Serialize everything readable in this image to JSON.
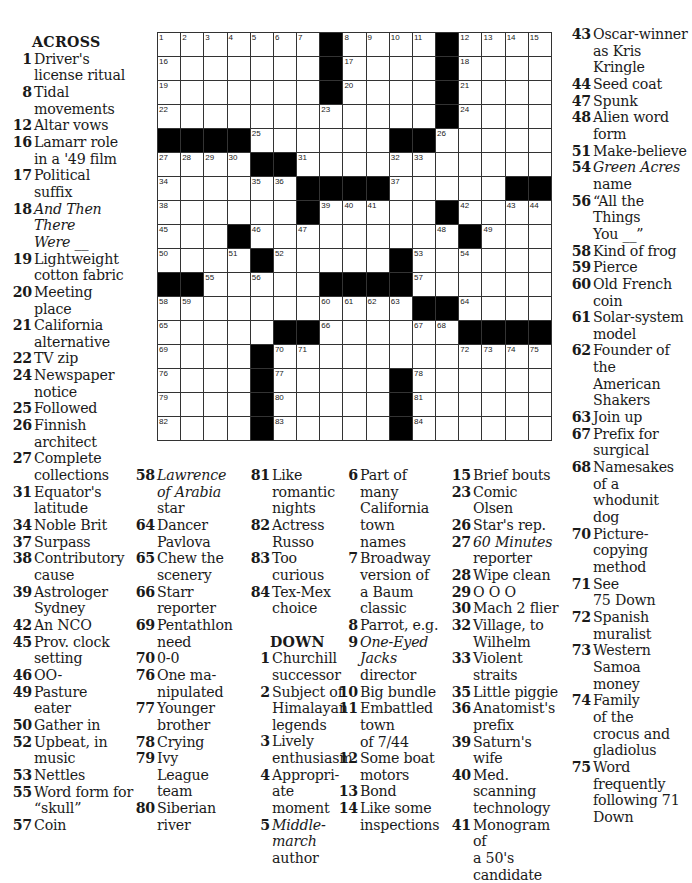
{
  "grid": {
    "rows": 17,
    "cols": 17,
    "black": [
      [
        0,
        7
      ],
      [
        0,
        12
      ],
      [
        1,
        7
      ],
      [
        1,
        12
      ],
      [
        2,
        7
      ],
      [
        2,
        12
      ],
      [
        3,
        12
      ],
      [
        4,
        0
      ],
      [
        4,
        1
      ],
      [
        4,
        2
      ],
      [
        4,
        3
      ],
      [
        4,
        10
      ],
      [
        4,
        11
      ],
      [
        5,
        4
      ],
      [
        5,
        5
      ],
      [
        6,
        6
      ],
      [
        6,
        7
      ],
      [
        6,
        8
      ],
      [
        6,
        9
      ],
      [
        6,
        15
      ],
      [
        6,
        16
      ],
      [
        7,
        6
      ],
      [
        7,
        12
      ],
      [
        8,
        3
      ],
      [
        8,
        13
      ],
      [
        9,
        4
      ],
      [
        9,
        10
      ],
      [
        10,
        0
      ],
      [
        10,
        1
      ],
      [
        10,
        7
      ],
      [
        10,
        8
      ],
      [
        10,
        9
      ],
      [
        10,
        10
      ],
      [
        11,
        11
      ],
      [
        11,
        12
      ],
      [
        12,
        5
      ],
      [
        12,
        6
      ],
      [
        12,
        13
      ],
      [
        12,
        14
      ],
      [
        12,
        15
      ],
      [
        12,
        16
      ],
      [
        13,
        4
      ],
      [
        14,
        4
      ],
      [
        14,
        10
      ],
      [
        15,
        4
      ],
      [
        15,
        10
      ],
      [
        16,
        4
      ],
      [
        16,
        10
      ]
    ],
    "numbers": [
      [
        0,
        0,
        1
      ],
      [
        0,
        1,
        2
      ],
      [
        0,
        2,
        3
      ],
      [
        0,
        3,
        4
      ],
      [
        0,
        4,
        5
      ],
      [
        0,
        5,
        6
      ],
      [
        0,
        6,
        7
      ],
      [
        0,
        8,
        8
      ],
      [
        0,
        9,
        9
      ],
      [
        0,
        10,
        10
      ],
      [
        0,
        11,
        11
      ],
      [
        0,
        13,
        12
      ],
      [
        0,
        14,
        13
      ],
      [
        0,
        15,
        14
      ],
      [
        0,
        16,
        15
      ],
      [
        1,
        0,
        16
      ],
      [
        1,
        8,
        17
      ],
      [
        1,
        13,
        18
      ],
      [
        2,
        0,
        19
      ],
      [
        2,
        8,
        20
      ],
      [
        2,
        13,
        21
      ],
      [
        3,
        0,
        22
      ],
      [
        3,
        7,
        23
      ],
      [
        3,
        13,
        24
      ],
      [
        4,
        4,
        25
      ],
      [
        4,
        12,
        26
      ],
      [
        5,
        0,
        27
      ],
      [
        5,
        1,
        28
      ],
      [
        5,
        2,
        29
      ],
      [
        5,
        3,
        30
      ],
      [
        5,
        6,
        31
      ],
      [
        5,
        10,
        32
      ],
      [
        5,
        11,
        33
      ],
      [
        6,
        0,
        34
      ],
      [
        6,
        4,
        35
      ],
      [
        6,
        5,
        36
      ],
      [
        6,
        10,
        37
      ],
      [
        7,
        0,
        38
      ],
      [
        7,
        7,
        39
      ],
      [
        7,
        8,
        40
      ],
      [
        7,
        9,
        41
      ],
      [
        7,
        13,
        42
      ],
      [
        7,
        15,
        43
      ],
      [
        7,
        16,
        44
      ],
      [
        8,
        0,
        45
      ],
      [
        8,
        4,
        46
      ],
      [
        8,
        6,
        47
      ],
      [
        8,
        12,
        48
      ],
      [
        8,
        14,
        49
      ],
      [
        9,
        0,
        50
      ],
      [
        9,
        3,
        51
      ],
      [
        9,
        5,
        52
      ],
      [
        9,
        11,
        53
      ],
      [
        9,
        13,
        54
      ],
      [
        10,
        2,
        55
      ],
      [
        10,
        4,
        56
      ],
      [
        10,
        11,
        57
      ],
      [
        11,
        0,
        58
      ],
      [
        11,
        1,
        59
      ],
      [
        11,
        7,
        60
      ],
      [
        11,
        8,
        61
      ],
      [
        11,
        9,
        62
      ],
      [
        11,
        10,
        63
      ],
      [
        11,
        13,
        64
      ],
      [
        12,
        0,
        65
      ],
      [
        12,
        7,
        66
      ],
      [
        12,
        11,
        67
      ],
      [
        12,
        12,
        68
      ],
      [
        13,
        0,
        69
      ],
      [
        13,
        5,
        70
      ],
      [
        13,
        6,
        71
      ],
      [
        13,
        13,
        72
      ],
      [
        13,
        14,
        73
      ],
      [
        13,
        15,
        74
      ],
      [
        13,
        16,
        75
      ],
      [
        14,
        0,
        76
      ],
      [
        14,
        5,
        77
      ],
      [
        14,
        11,
        78
      ],
      [
        15,
        0,
        79
      ],
      [
        15,
        5,
        80
      ],
      [
        15,
        11,
        81
      ],
      [
        16,
        0,
        82
      ],
      [
        16,
        5,
        83
      ],
      [
        16,
        11,
        84
      ]
    ]
  },
  "across_header": "ACROSS",
  "down_header": "DOWN",
  "columns": {
    "c1": [
      {
        "n": "1",
        "lines": [
          "Driver's",
          "license ritual"
        ]
      },
      {
        "n": "8",
        "lines": [
          "Tidal",
          "movements"
        ]
      },
      {
        "n": "12",
        "lines": [
          "Altar vows"
        ]
      },
      {
        "n": "16",
        "lines": [
          "Lamarr role",
          "in a '49 film"
        ]
      },
      {
        "n": "17",
        "lines": [
          "Political",
          "suffix"
        ]
      },
      {
        "n": "18",
        "lines": [
          "And Then",
          "There",
          "Were __"
        ],
        "italic": [
          0,
          1,
          2
        ]
      },
      {
        "n": "19",
        "lines": [
          "Lightweight",
          "cotton fabric"
        ]
      },
      {
        "n": "20",
        "lines": [
          "Meeting",
          "place"
        ]
      },
      {
        "n": "21",
        "lines": [
          "California",
          "alternative"
        ]
      },
      {
        "n": "22",
        "lines": [
          "TV zip"
        ]
      },
      {
        "n": "24",
        "lines": [
          "Newspaper",
          "notice"
        ]
      },
      {
        "n": "25",
        "lines": [
          "Followed"
        ]
      },
      {
        "n": "26",
        "lines": [
          "Finnish",
          "architect"
        ]
      },
      {
        "n": "27",
        "lines": [
          "Complete",
          "collections"
        ]
      },
      {
        "n": "31",
        "lines": [
          "Equator's",
          "latitude"
        ]
      },
      {
        "n": "34",
        "lines": [
          "Noble Brit"
        ]
      },
      {
        "n": "37",
        "lines": [
          "Surpass"
        ]
      },
      {
        "n": "38",
        "lines": [
          "Contributory",
          "cause"
        ]
      },
      {
        "n": "39",
        "lines": [
          "Astrologer",
          "Sydney"
        ]
      },
      {
        "n": "42",
        "lines": [
          "An NCO"
        ]
      },
      {
        "n": "45",
        "lines": [
          "Prov. clock",
          "setting"
        ]
      },
      {
        "n": "46",
        "lines": [
          "OO-"
        ]
      },
      {
        "n": "49",
        "lines": [
          "Pasture",
          "eater"
        ]
      },
      {
        "n": "50",
        "lines": [
          "Gather in"
        ]
      },
      {
        "n": "52",
        "lines": [
          "Upbeat, in",
          "music"
        ]
      },
      {
        "n": "53",
        "lines": [
          "Nettles"
        ]
      },
      {
        "n": "55",
        "lines": [
          "Word form for",
          "“skull”"
        ]
      },
      {
        "n": "57",
        "lines": [
          "Coin"
        ]
      }
    ],
    "c2": [
      {
        "n": "58",
        "lines": [
          "Lawrence",
          "of Arabia",
          "star"
        ],
        "italic": [
          0,
          1
        ]
      },
      {
        "n": "64",
        "lines": [
          "Dancer",
          "Pavlova"
        ]
      },
      {
        "n": "65",
        "lines": [
          "Chew the",
          "scenery"
        ]
      },
      {
        "n": "66",
        "lines": [
          "Starr",
          "reporter"
        ]
      },
      {
        "n": "69",
        "lines": [
          "Pentathlon",
          "need"
        ]
      },
      {
        "n": "70",
        "lines": [
          "0-0"
        ]
      },
      {
        "n": "76",
        "lines": [
          "One ma-",
          "nipulated"
        ]
      },
      {
        "n": "77",
        "lines": [
          "Younger",
          "brother"
        ]
      },
      {
        "n": "78",
        "lines": [
          "Crying"
        ]
      },
      {
        "n": "79",
        "lines": [
          "Ivy",
          "League",
          "team"
        ]
      },
      {
        "n": "80",
        "lines": [
          "Siberian",
          "river"
        ]
      }
    ],
    "c3a": [
      {
        "n": "81",
        "lines": [
          "Like",
          "romantic",
          "nights"
        ]
      },
      {
        "n": "82",
        "lines": [
          "Actress",
          "Russo"
        ]
      },
      {
        "n": "83",
        "lines": [
          "Too curious"
        ]
      },
      {
        "n": "84",
        "lines": [
          "Tex-Mex",
          "choice"
        ]
      }
    ],
    "c3b": [
      {
        "n": "1",
        "lines": [
          "Churchill",
          "successor"
        ]
      },
      {
        "n": "2",
        "lines": [
          "Subject of",
          "Himalayan",
          "legends"
        ]
      },
      {
        "n": "3",
        "lines": [
          "Lively",
          "enthusiasm"
        ]
      },
      {
        "n": "4",
        "lines": [
          "Appropri-",
          "ate moment"
        ]
      },
      {
        "n": "5",
        "lines": [
          "Middle-",
          "march",
          "author"
        ],
        "italic": [
          0,
          1
        ]
      }
    ],
    "c4": [
      {
        "n": "6",
        "lines": [
          "Part of",
          "many",
          "California",
          "town",
          "names"
        ]
      },
      {
        "n": "7",
        "lines": [
          "Broadway",
          "version of",
          "a Baum",
          "classic"
        ]
      },
      {
        "n": "8",
        "lines": [
          "Parrot, e.g."
        ]
      },
      {
        "n": "9",
        "lines": [
          "One-Eyed",
          "Jacks",
          "director"
        ],
        "italic": [
          0,
          1
        ]
      },
      {
        "n": "10",
        "lines": [
          "Big bundle"
        ]
      },
      {
        "n": "11",
        "lines": [
          "Embattled",
          "town",
          "of 7/44"
        ]
      },
      {
        "n": "12",
        "lines": [
          "Some boat",
          "motors"
        ]
      },
      {
        "n": "13",
        "lines": [
          "Bond"
        ]
      },
      {
        "n": "14",
        "lines": [
          "Like some",
          "inspections"
        ]
      }
    ],
    "c5": [
      {
        "n": "15",
        "lines": [
          "Brief bouts"
        ]
      },
      {
        "n": "23",
        "lines": [
          "Comic",
          "Olsen"
        ]
      },
      {
        "n": "26",
        "lines": [
          "Star's rep."
        ]
      },
      {
        "n": "27",
        "lines": [
          "60 Minutes",
          "reporter"
        ],
        "italic": [
          0
        ]
      },
      {
        "n": "28",
        "lines": [
          "Wipe clean"
        ]
      },
      {
        "n": "29",
        "lines": [
          "O O O"
        ]
      },
      {
        "n": "30",
        "lines": [
          "Mach 2 flier"
        ]
      },
      {
        "n": "32",
        "lines": [
          "Village, to",
          "Wilhelm"
        ]
      },
      {
        "n": "33",
        "lines": [
          "Violent straits"
        ]
      },
      {
        "n": "35",
        "lines": [
          "Little piggie"
        ]
      },
      {
        "n": "36",
        "lines": [
          "Anatomist's",
          "prefix"
        ]
      },
      {
        "n": "39",
        "lines": [
          "Saturn's wife"
        ]
      },
      {
        "n": "40",
        "lines": [
          "Med.",
          "scanning",
          "technology"
        ]
      },
      {
        "n": "41",
        "lines": [
          "Monogram of",
          "a 50's",
          "candidate"
        ]
      }
    ],
    "c6": [
      {
        "n": "43",
        "lines": [
          "Oscar-winner",
          "as Kris",
          "Kringle"
        ]
      },
      {
        "n": "44",
        "lines": [
          "Seed coat"
        ]
      },
      {
        "n": "47",
        "lines": [
          "Spunk"
        ]
      },
      {
        "n": "48",
        "lines": [
          "Alien word",
          "form"
        ]
      },
      {
        "n": "51",
        "lines": [
          "Make-believe"
        ]
      },
      {
        "n": "54",
        "lines": [
          "Green Acres",
          "name"
        ],
        "italic": [
          0
        ]
      },
      {
        "n": "56",
        "lines": [
          "“All the",
          "Things",
          "You __”"
        ]
      },
      {
        "n": "58",
        "lines": [
          "Kind of frog"
        ]
      },
      {
        "n": "59",
        "lines": [
          "Pierce"
        ]
      },
      {
        "n": "60",
        "lines": [
          "Old French",
          "coin"
        ]
      },
      {
        "n": "61",
        "lines": [
          "Solar-system",
          "model"
        ]
      },
      {
        "n": "62",
        "lines": [
          "Founder of",
          "the",
          "American",
          "Shakers"
        ]
      },
      {
        "n": "63",
        "lines": [
          "Join up"
        ]
      },
      {
        "n": "67",
        "lines": [
          "Prefix for",
          "surgical"
        ]
      },
      {
        "n": "68",
        "lines": [
          "Namesakes",
          "of a",
          "whodunit",
          "dog"
        ]
      },
      {
        "n": "70",
        "lines": [
          "Picture-",
          "copying",
          "method"
        ]
      },
      {
        "n": "71",
        "lines": [
          "See",
          "75 Down"
        ]
      },
      {
        "n": "72",
        "lines": [
          "Spanish",
          "muralist"
        ]
      },
      {
        "n": "73",
        "lines": [
          "Western",
          "Samoa",
          "money"
        ]
      },
      {
        "n": "74",
        "lines": [
          "Family",
          "of the",
          "crocus and",
          "gladiolus"
        ]
      },
      {
        "n": "75",
        "lines": [
          "Word",
          "frequently",
          "following 71",
          "Down"
        ]
      }
    ]
  }
}
